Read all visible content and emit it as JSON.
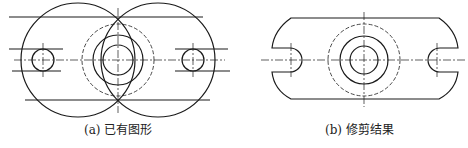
{
  "figures": [
    {
      "id": "a",
      "caption": "(a) 已有图形"
    },
    {
      "id": "b",
      "caption": "(b) 修剪结果"
    }
  ],
  "colors": {
    "line": "#1a1a1a",
    "background": "#ffffff"
  }
}
